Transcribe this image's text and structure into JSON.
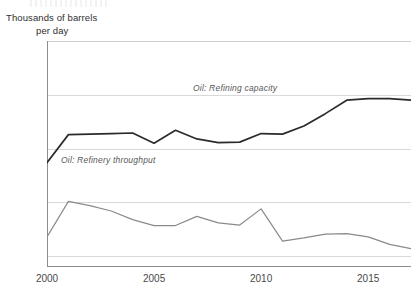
{
  "axis_title": {
    "line1": "Thousands of barrels",
    "line2": "per day"
  },
  "series_labels": {
    "capacity": "Oil: Refining capacity",
    "throughput": "Oil: Refinery throughput"
  },
  "ticks": {
    "y": [
      "2,000",
      "2,500",
      "3,000",
      "3,500"
    ],
    "x": [
      "2000",
      "2005",
      "2010",
      "2015"
    ]
  },
  "colors": {
    "capacity": "#2b2b2b",
    "throughput": "#8a8a8a",
    "grid": "#d9d9d9",
    "axis": "#8d8d8d",
    "text": "#3b3b3b"
  },
  "chart_data": {
    "type": "line",
    "title": "",
    "subtitle": "",
    "xlabel": "",
    "ylabel": "Thousands of barrels per day",
    "xlim": [
      2000,
      2017
    ],
    "ylim": [
      1900,
      4000
    ],
    "yticks": [
      2000,
      2500,
      3000,
      3500
    ],
    "xticks": [
      2000,
      2005,
      2010,
      2015
    ],
    "grid": true,
    "legend_position": "inline-annotation",
    "x": [
      2000,
      2001,
      2002,
      2003,
      2004,
      2005,
      2006,
      2007,
      2008,
      2009,
      2010,
      2011,
      2012,
      2013,
      2014,
      2015,
      2016,
      2017
    ],
    "series": [
      {
        "name": "Oil: Refining capacity",
        "color": "#2b2b2b",
        "values": [
          2870,
          3130,
          3135,
          3140,
          3145,
          3050,
          3170,
          3090,
          3055,
          3060,
          3140,
          3135,
          3210,
          3325,
          3450,
          3465,
          3465,
          3450
        ]
      },
      {
        "name": "Oil: Refinery throughput",
        "color": "#8a8a8a",
        "values": [
          2180,
          2510,
          2470,
          2420,
          2340,
          2285,
          2285,
          2370,
          2310,
          2290,
          2440,
          2140,
          2170,
          2205,
          2210,
          2180,
          2110,
          2070
        ]
      }
    ]
  }
}
